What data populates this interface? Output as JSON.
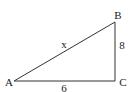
{
  "diagram": {
    "type": "right-triangle",
    "vertices": [
      {
        "id": "A",
        "label": "A",
        "x": 14,
        "y": 81,
        "label_x": 9,
        "label_y": 86
      },
      {
        "id": "B",
        "label": "B",
        "x": 115,
        "y": 22,
        "label_x": 118,
        "label_y": 18
      },
      {
        "id": "C",
        "label": "C",
        "x": 115,
        "y": 81,
        "label_x": 123,
        "label_y": 86
      }
    ],
    "sides": [
      {
        "id": "AB",
        "label": "x",
        "label_x": 64,
        "label_y": 48
      },
      {
        "id": "BC",
        "label": "8",
        "label_x": 122,
        "label_y": 49
      },
      {
        "id": "AC",
        "label": "6",
        "label_x": 64,
        "label_y": 92
      }
    ],
    "right_angle_at": "C",
    "stroke_color": "#333333"
  }
}
